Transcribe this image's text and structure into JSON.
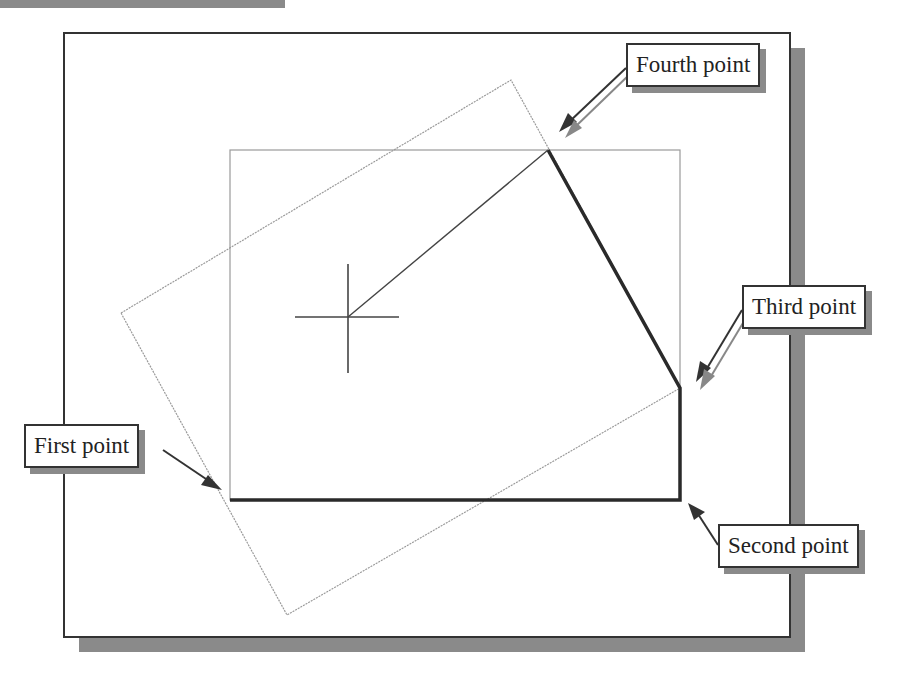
{
  "figure": {
    "type": "cad-rectangle-by-points-diagram",
    "colors": {
      "frame": "#333333",
      "shadow": "#8a8a8a",
      "construction_line": "#9a9a9a",
      "thick_edge": "#2a2a2a",
      "background": "#ffffff"
    }
  },
  "callouts": {
    "fourth": {
      "label": "Fourth point"
    },
    "third": {
      "label": "Third point"
    },
    "first": {
      "label": "First point"
    },
    "second": {
      "label": "Second point"
    }
  },
  "geometry": {
    "frame": {
      "x": 64,
      "y": 33,
      "w": 726,
      "h": 604
    },
    "inner_rect": {
      "x": 230,
      "y": 150,
      "w": 450,
      "h": 350
    },
    "rotated_rect": [
      [
        121,
        313
      ],
      [
        511,
        80
      ],
      [
        680,
        388
      ],
      [
        287,
        615
      ]
    ],
    "thick_polyline": [
      [
        230,
        500
      ],
      [
        680,
        500
      ],
      [
        680,
        388
      ],
      [
        548,
        150
      ]
    ],
    "rubber_band_line": [
      [
        548,
        150
      ],
      [
        348,
        317
      ]
    ],
    "crosshair": {
      "cx": 348,
      "cy": 317,
      "h_from": 295,
      "h_to": 399,
      "v_from": 264,
      "v_to": 373
    }
  }
}
